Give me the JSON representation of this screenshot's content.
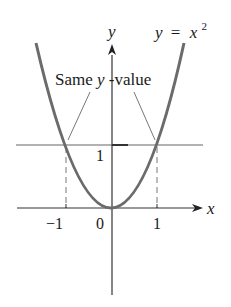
{
  "diagram": {
    "function_label": {
      "lhs": "y",
      "eq": "=",
      "rhs": "x",
      "exp": "2"
    },
    "axis_labels": {
      "x": "x",
      "y": "y"
    },
    "annotation": {
      "prefix": "Same ",
      "var": "y",
      "suffix": "-value"
    },
    "tick_labels": {
      "neg_one": "−1",
      "zero": "0",
      "one": "1",
      "y_one": "1"
    },
    "colors": {
      "curve": "#6b6b6b",
      "axes": "#333333",
      "guides": "#777777",
      "text": "#1a1a1a"
    }
  }
}
